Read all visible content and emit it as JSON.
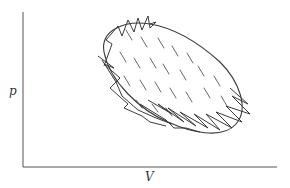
{
  "diagram": {
    "type": "p-V diagram",
    "axes": {
      "y_label": "p",
      "x_label": "V"
    },
    "colors": {
      "line": "#3a3a3a",
      "axis": "#555555",
      "hatch": "#555555",
      "background": "#ffffff"
    },
    "elements": {
      "smooth_cycle": "closed tilted elliptical loop",
      "zigzag_path": "sawtooth path approximating the cycle along upper-left and lower-right edges",
      "hatching": "short diagonal strokes filling enclosed area"
    }
  }
}
